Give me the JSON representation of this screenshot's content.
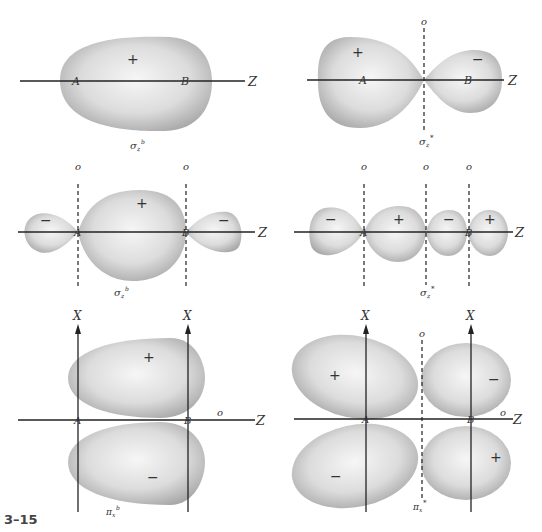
{
  "figure": {
    "number": "3–15",
    "panels": [
      {
        "id": "sigma_z_b_s",
        "caption": "σzᵇ",
        "caption_main": "σ",
        "caption_sub": "z",
        "caption_sup": "b",
        "signs": [
          "+"
        ],
        "atoms": [
          "A",
          "B"
        ],
        "axis": "Z",
        "nodes": []
      },
      {
        "id": "sigma_z_star_s",
        "caption_main": "σ",
        "caption_sub": "z",
        "caption_sup": "*",
        "signs": [
          "+",
          "−"
        ],
        "atoms": [
          "A",
          "B"
        ],
        "axis": "Z",
        "nodes": [
          "o"
        ]
      },
      {
        "id": "sigma_z_b_p",
        "caption_main": "σ",
        "caption_sub": "z",
        "caption_sup": "b",
        "signs": [
          "−",
          "+",
          "−"
        ],
        "atoms": [
          "A",
          "B"
        ],
        "axis": "Z",
        "nodes": [
          "o",
          "o"
        ]
      },
      {
        "id": "sigma_z_star_p",
        "caption_main": "σ",
        "caption_sub": "z",
        "caption_sup": "*",
        "signs": [
          "−",
          "+",
          "−",
          "+"
        ],
        "atoms": [
          "A",
          "B"
        ],
        "axis": "Z",
        "nodes": [
          "o",
          "o",
          "o"
        ]
      },
      {
        "id": "pi_x_b",
        "caption_main": "π",
        "caption_sub": "x",
        "caption_sup": "b",
        "signs": [
          "+",
          "−"
        ],
        "atoms": [
          "A",
          "B"
        ],
        "axis": "Z",
        "vertical_axes": [
          "X",
          "X"
        ],
        "nodes": [
          "o"
        ]
      },
      {
        "id": "pi_x_star",
        "caption_main": "π",
        "caption_sub": "x",
        "caption_sup": "*",
        "signs": [
          "+",
          "−",
          "−",
          "+"
        ],
        "atoms": [
          "A",
          "B"
        ],
        "axis": "Z",
        "vertical_axes": [
          "X",
          "X"
        ],
        "nodes": [
          "o",
          "o"
        ]
      }
    ]
  },
  "colors": {
    "lobe_light": "#f4f4f4",
    "lobe_dark": "#a9a9a9",
    "line": "#222222"
  }
}
